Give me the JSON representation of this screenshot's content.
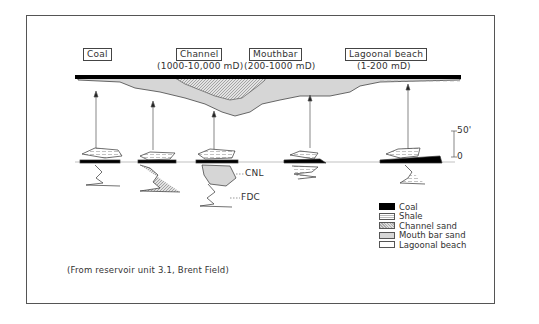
{
  "title_boxes": {
    "coal": "Coal",
    "channel": "Channel",
    "mouthbar": "Mouthbar",
    "lagoonal": "Lagoonal beach"
  },
  "permeability": {
    "channel": "(1000-10,000 mD)",
    "mouthbar": "(200-1000 mD)",
    "lagoonal": "(1-200 mD)"
  },
  "log_labels": {
    "cnl": "CNL",
    "fdc": "FDC"
  },
  "scale": {
    "top": "50'",
    "bottom": "0"
  },
  "legend": [
    {
      "label": "Coal",
      "pattern": "coal"
    },
    {
      "label": "Shale",
      "pattern": "shale"
    },
    {
      "label": "Channel sand",
      "pattern": "channel"
    },
    {
      "label": "Mouth bar sand",
      "pattern": "mouth"
    },
    {
      "label": "Lagoonal beach",
      "pattern": "lagoon"
    }
  ],
  "source_note": "(From reservoir unit 3.1, Brent Field)",
  "colors": {
    "coal": "#000000",
    "mouth_bar_sand": "#d6d6d6",
    "channel_sand": "#b8b8b8",
    "frame": "#555555"
  }
}
